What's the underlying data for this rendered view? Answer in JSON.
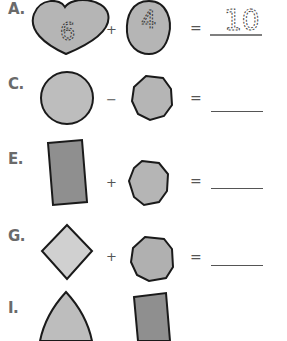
{
  "worksheet": {
    "colors": {
      "light_fill": "#c4c4c4",
      "medium_fill": "#b0b0b0",
      "dark_fill": "#8f8f8f",
      "stroke": "#1a1a1a",
      "text": "#555555"
    },
    "problems": [
      {
        "label": "A.",
        "left_shape": "heart",
        "left_value": "6",
        "operator": "+",
        "right_shape": "oval",
        "right_value": "4",
        "equals": "=",
        "answer": "10"
      },
      {
        "label": "C.",
        "left_shape": "circle",
        "operator": "−",
        "right_shape": "octagon",
        "equals": "=",
        "answer": ""
      },
      {
        "label": "E.",
        "left_shape": "rectangle",
        "operator": "+",
        "right_shape": "octagon",
        "equals": "=",
        "answer": ""
      },
      {
        "label": "G.",
        "left_shape": "diamond",
        "operator": "+",
        "right_shape": "octagon",
        "equals": "=",
        "answer": ""
      },
      {
        "label": "I.",
        "left_shape": "triangle",
        "right_shape": "rectangle"
      }
    ]
  }
}
